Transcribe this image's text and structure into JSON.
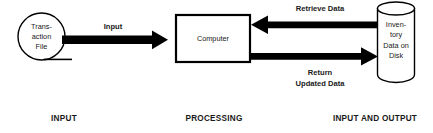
{
  "diagram": {
    "background_color": "#ffffff",
    "line_color": "#000000",
    "text_color": "#1a1a1a",
    "nodes": {
      "transaction_file": {
        "shape": "magnetic-tape-circle",
        "line1": "Trans-",
        "line2": "action",
        "line3": "File"
      },
      "computer": {
        "shape": "rectangle",
        "label": "Computer"
      },
      "inventory_disk": {
        "shape": "cylinder",
        "line1": "Inven-",
        "line2": "tory",
        "line3": "Data on",
        "line4": "Disk"
      }
    },
    "flows": {
      "input_arrow": {
        "label": "Input",
        "direction": "right",
        "from": "transaction_file",
        "to": "computer"
      },
      "retrieve_arrow": {
        "label": "Retrieve Data",
        "direction": "left",
        "from": "inventory_disk",
        "to": "computer"
      },
      "return_arrow": {
        "label_line1": "Return",
        "label_line2": "Updated Data",
        "direction": "right",
        "from": "computer",
        "to": "inventory_disk"
      }
    },
    "captions": {
      "input": "INPUT",
      "processing": "PROCESSING",
      "input_and_output": "INPUT AND OUTPUT"
    }
  }
}
